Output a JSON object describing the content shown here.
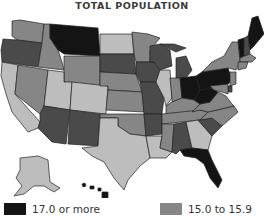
{
  "title": "TOTAL POPULATION",
  "colors": {
    "level_17_plus": "#141414",
    "level_16": "#4a4a4a",
    "level_15": "#868686",
    "level_below": "#bdbdbd",
    "border": "#222222",
    "background": "#ffffff"
  },
  "legend": [
    {
      "label": "17.0 or more",
      "color": "#141414"
    },
    {
      "label": "15.0 to 15.9",
      "color": "#868686"
    }
  ],
  "states": {
    "WA": "level_15",
    "OR": "level_16",
    "CA": "level_below",
    "ID": "level_15",
    "NV": "level_15",
    "MT": "level_17_plus",
    "WY": "level_15",
    "UT": "level_below",
    "AZ": "level_16",
    "CO": "level_below",
    "NM": "level_16",
    "ND": "level_below",
    "SD": "level_16",
    "NE": "level_15",
    "KS": "level_15",
    "OK": "level_15",
    "TX": "level_below",
    "MN": "level_15",
    "IA": "level_16",
    "MO": "level_16",
    "AR": "level_16",
    "LA": "level_below",
    "WI": "level_16",
    "IL": "level_below",
    "MI": "level_16",
    "IN": "level_15",
    "OH": "level_17_plus",
    "KY": "level_15",
    "TN": "level_15",
    "MS": "level_15",
    "AL": "level_16",
    "GA": "level_below",
    "FL": "level_17_plus",
    "SC": "level_16",
    "NC": "level_15",
    "VA": "level_15",
    "WV": "level_17_plus",
    "PA": "level_17_plus",
    "NY": "level_15",
    "VT": "level_17_plus",
    "NH": "level_16",
    "ME": "level_17_plus",
    "MA": "level_15",
    "CT": "level_15",
    "NJ": "level_15",
    "DE": "level_16",
    "MD": "level_15",
    "AK": "level_below",
    "HI": "level_17_plus"
  }
}
